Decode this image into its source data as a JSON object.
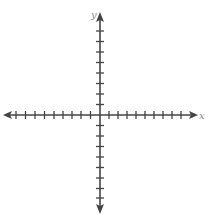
{
  "diagram": {
    "type": "coordinate-plane",
    "x_axis": {
      "label": "x",
      "ticks_negative": 9,
      "ticks_positive": 9
    },
    "y_axis": {
      "label": "y",
      "ticks_negative": 9,
      "ticks_positive": 8
    },
    "colors": {
      "axis": "#444444",
      "label": "#8a8a8a",
      "background": "#ffffff"
    }
  }
}
